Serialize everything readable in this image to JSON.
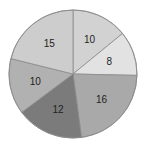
{
  "chart_data": {
    "type": "pie",
    "title": "",
    "categories": [
      "A",
      "B",
      "C",
      "D",
      "E",
      "F"
    ],
    "values": [
      10,
      8,
      16,
      12,
      10,
      15
    ],
    "labels": [
      "10",
      "8",
      "16",
      "12",
      "10",
      "15"
    ],
    "colors": [
      "#d2d2d2",
      "#e2e2e2",
      "#a9a9a9",
      "#7b7b7b",
      "#b1b1b1",
      "#cdcdcd"
    ],
    "start_angle_deg": 0,
    "direction": "clockwise",
    "legend": "none",
    "edge_color": "#8a8a8a"
  }
}
